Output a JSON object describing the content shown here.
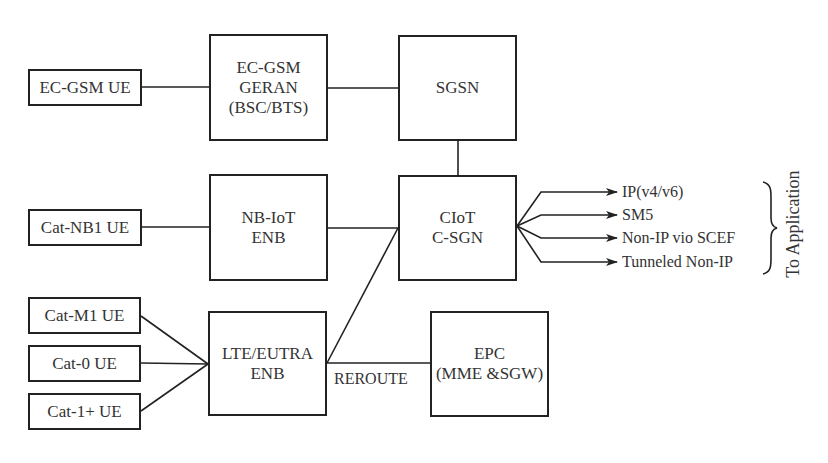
{
  "diagram": {
    "nodes": {
      "ec_gsm_ue": {
        "label": "EC-GSM UE"
      },
      "cat_nb1_ue": {
        "label": "Cat-NB1 UE"
      },
      "cat_m1_ue": {
        "label": "Cat-M1 UE"
      },
      "cat_0_ue": {
        "label": "Cat-0 UE"
      },
      "cat_1plus_ue": {
        "label": "Cat-1+ UE"
      },
      "geran": {
        "label": "EC-GSM\nGERAN\n(BSC/BTS)"
      },
      "nbiot_enb": {
        "label": "NB-IoT\nENB"
      },
      "lte_enb": {
        "label": "LTE/EUTRA\nENB"
      },
      "sgsn": {
        "label": "SGSN"
      },
      "ciot_csgn": {
        "label": "CIoT\nC-SGN"
      },
      "epc": {
        "label": "EPC\n(MME &SGW)"
      }
    },
    "edge_labels": {
      "reroute": "REROUTE"
    },
    "outputs": [
      {
        "label": "IP(v4/v6)"
      },
      {
        "label": "SM5"
      },
      {
        "label": "Non-IP vio SCEF"
      },
      {
        "label": "Tunneled Non-IP"
      }
    ],
    "group_label": "To Application",
    "edges": [
      [
        "ec_gsm_ue",
        "geran"
      ],
      [
        "geran",
        "sgsn"
      ],
      [
        "sgsn",
        "ciot_csgn"
      ],
      [
        "cat_nb1_ue",
        "nbiot_enb"
      ],
      [
        "nbiot_enb",
        "ciot_csgn"
      ],
      [
        "cat_m1_ue",
        "lte_enb"
      ],
      [
        "cat_0_ue",
        "lte_enb"
      ],
      [
        "cat_1plus_ue",
        "lte_enb"
      ],
      [
        "lte_enb",
        "ciot_csgn"
      ],
      [
        "lte_enb",
        "epc"
      ]
    ]
  }
}
